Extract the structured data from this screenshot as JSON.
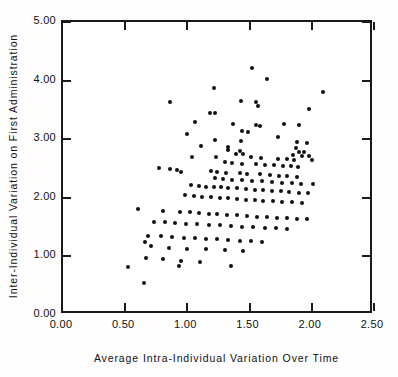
{
  "chart_data": {
    "type": "scatter",
    "title": "",
    "xlabel": "Average Intra-Individual Variation Over Time",
    "ylabel": "Inter-Individual Variation on First Administration",
    "xlim": [
      0.0,
      2.5
    ],
    "ylim": [
      0.0,
      5.0
    ],
    "xticks": [
      0.0,
      0.5,
      1.0,
      1.5,
      2.0,
      2.5
    ],
    "xtick_labels": [
      "0.00",
      "0.50",
      "1.00",
      "1.50",
      "2.00",
      "2.50"
    ],
    "yticks": [
      0.0,
      1.0,
      2.0,
      3.0,
      4.0,
      5.0
    ],
    "ytick_labels": [
      "0.00",
      "1.00",
      "2.00",
      "3.00",
      "4.00",
      "5.00"
    ],
    "grid": false,
    "legend": null,
    "marker": "filled-circle",
    "marker_color": "#111111",
    "n_points": 163,
    "points": [
      [
        1.52,
        4.21
      ],
      [
        1.64,
        4.02
      ],
      [
        1.21,
        3.88
      ],
      [
        2.09,
        3.8
      ],
      [
        0.86,
        3.64
      ],
      [
        1.43,
        3.66
      ],
      [
        1.55,
        3.63
      ],
      [
        1.57,
        3.56
      ],
      [
        1.98,
        3.51
      ],
      [
        1.18,
        3.45
      ],
      [
        1.22,
        3.44
      ],
      [
        1.06,
        3.3
      ],
      [
        1.37,
        3.26
      ],
      [
        1.78,
        3.26
      ],
      [
        1.55,
        3.24
      ],
      [
        1.9,
        3.24
      ],
      [
        1.58,
        3.22
      ],
      [
        1.44,
        3.14
      ],
      [
        1.49,
        3.12
      ],
      [
        1.0,
        3.09
      ],
      [
        1.73,
        3.04
      ],
      [
        1.22,
        2.99
      ],
      [
        1.43,
        2.97
      ],
      [
        1.88,
        2.95
      ],
      [
        1.96,
        2.93
      ],
      [
        1.11,
        2.88
      ],
      [
        1.33,
        2.86
      ],
      [
        1.87,
        2.85
      ],
      [
        1.33,
        2.82
      ],
      [
        1.42,
        2.8
      ],
      [
        1.9,
        2.79
      ],
      [
        1.94,
        2.78
      ],
      [
        1.39,
        2.75
      ],
      [
        1.45,
        2.74
      ],
      [
        1.85,
        2.73
      ],
      [
        1.92,
        2.72
      ],
      [
        1.98,
        2.72
      ],
      [
        1.04,
        2.7
      ],
      [
        1.23,
        2.7
      ],
      [
        1.51,
        2.69
      ],
      [
        1.59,
        2.68
      ],
      [
        1.73,
        2.67
      ],
      [
        1.8,
        2.66
      ],
      [
        1.86,
        2.65
      ],
      [
        2.0,
        2.64
      ],
      [
        1.3,
        2.61
      ],
      [
        1.36,
        2.6
      ],
      [
        1.44,
        2.58
      ],
      [
        1.55,
        2.57
      ],
      [
        1.62,
        2.56
      ],
      [
        1.7,
        2.56
      ],
      [
        1.77,
        2.55
      ],
      [
        1.83,
        2.54
      ],
      [
        1.89,
        2.53
      ],
      [
        0.77,
        2.51
      ],
      [
        0.86,
        2.49
      ],
      [
        0.92,
        2.47
      ],
      [
        0.95,
        2.44
      ],
      [
        1.19,
        2.45
      ],
      [
        1.24,
        2.44
      ],
      [
        1.31,
        2.43
      ],
      [
        1.42,
        2.42
      ],
      [
        1.48,
        2.41
      ],
      [
        1.58,
        2.4
      ],
      [
        1.66,
        2.39
      ],
      [
        1.74,
        2.38
      ],
      [
        1.8,
        2.37
      ],
      [
        1.88,
        2.36
      ],
      [
        1.22,
        2.33
      ],
      [
        1.29,
        2.32
      ],
      [
        1.36,
        2.31
      ],
      [
        1.44,
        2.3
      ],
      [
        1.52,
        2.29
      ],
      [
        1.6,
        2.28
      ],
      [
        1.68,
        2.27
      ],
      [
        1.76,
        2.26
      ],
      [
        1.84,
        2.25
      ],
      [
        1.91,
        2.24
      ],
      [
        2.01,
        2.23
      ],
      [
        1.03,
        2.21
      ],
      [
        1.09,
        2.2
      ],
      [
        1.15,
        2.19
      ],
      [
        1.21,
        2.18
      ],
      [
        1.27,
        2.18
      ],
      [
        1.33,
        2.17
      ],
      [
        1.4,
        2.16
      ],
      [
        1.47,
        2.15
      ],
      [
        1.54,
        2.14
      ],
      [
        1.61,
        2.13
      ],
      [
        1.68,
        2.12
      ],
      [
        1.75,
        2.11
      ],
      [
        1.82,
        2.1
      ],
      [
        1.9,
        2.09
      ],
      [
        1.97,
        2.08
      ],
      [
        0.98,
        2.04
      ],
      [
        1.05,
        2.03
      ],
      [
        1.12,
        2.02
      ],
      [
        1.19,
        2.01
      ],
      [
        1.26,
        2.0
      ],
      [
        1.33,
        1.99
      ],
      [
        1.4,
        1.98
      ],
      [
        1.47,
        1.97
      ],
      [
        1.54,
        1.96
      ],
      [
        1.61,
        1.95
      ],
      [
        1.69,
        1.94
      ],
      [
        1.76,
        1.93
      ],
      [
        1.84,
        1.92
      ],
      [
        1.92,
        1.91
      ],
      [
        0.6,
        1.81
      ],
      [
        0.8,
        1.77
      ],
      [
        0.94,
        1.76
      ],
      [
        1.02,
        1.75
      ],
      [
        1.09,
        1.74
      ],
      [
        1.17,
        1.73
      ],
      [
        1.24,
        1.72
      ],
      [
        1.32,
        1.71
      ],
      [
        1.4,
        1.7
      ],
      [
        1.48,
        1.69
      ],
      [
        1.56,
        1.68
      ],
      [
        1.64,
        1.67
      ],
      [
        1.72,
        1.66
      ],
      [
        1.8,
        1.65
      ],
      [
        1.88,
        1.64
      ],
      [
        1.96,
        1.63
      ],
      [
        0.73,
        1.59
      ],
      [
        0.82,
        1.58
      ],
      [
        0.9,
        1.57
      ],
      [
        0.99,
        1.56
      ],
      [
        1.08,
        1.55
      ],
      [
        1.17,
        1.54
      ],
      [
        1.26,
        1.53
      ],
      [
        1.35,
        1.52
      ],
      [
        1.44,
        1.51
      ],
      [
        1.53,
        1.5
      ],
      [
        1.62,
        1.49
      ],
      [
        1.71,
        1.48
      ],
      [
        1.8,
        1.47
      ],
      [
        0.68,
        1.35
      ],
      [
        0.79,
        1.34
      ],
      [
        0.88,
        1.33
      ],
      [
        0.97,
        1.32
      ],
      [
        1.06,
        1.31
      ],
      [
        1.15,
        1.3
      ],
      [
        1.24,
        1.29
      ],
      [
        1.33,
        1.28
      ],
      [
        1.42,
        1.27
      ],
      [
        1.51,
        1.26
      ],
      [
        1.6,
        1.25
      ],
      [
        0.66,
        1.24
      ],
      [
        0.71,
        1.17
      ],
      [
        0.85,
        1.15
      ],
      [
        1.0,
        1.13
      ],
      [
        1.15,
        1.12
      ],
      [
        1.3,
        1.11
      ],
      [
        1.45,
        1.1
      ],
      [
        0.67,
        0.97
      ],
      [
        0.8,
        0.95
      ],
      [
        0.95,
        0.93
      ],
      [
        1.1,
        0.9
      ],
      [
        0.52,
        0.82
      ],
      [
        0.93,
        0.83
      ],
      [
        1.35,
        0.84
      ],
      [
        0.65,
        0.54
      ]
    ]
  }
}
